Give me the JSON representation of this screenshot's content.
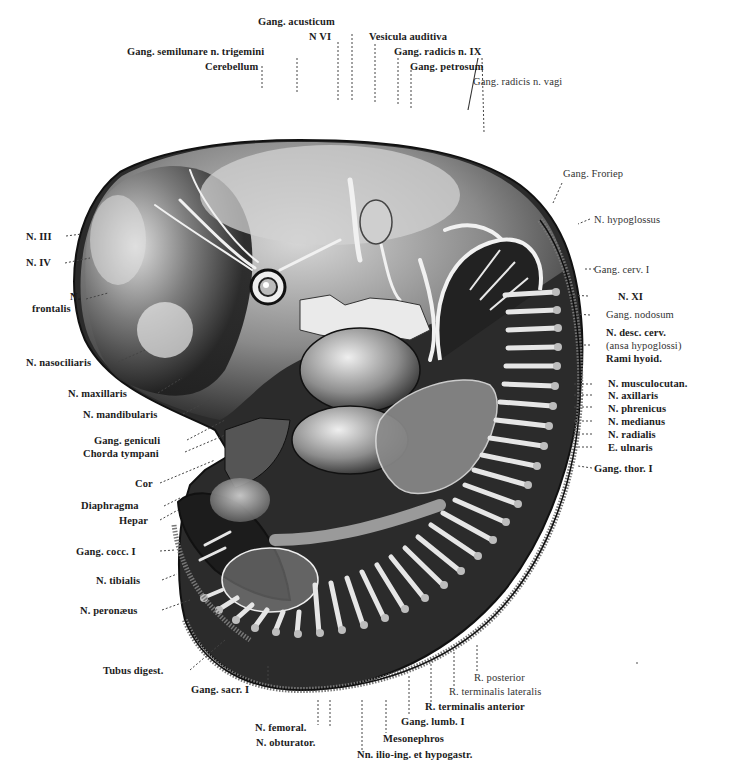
{
  "figure": {
    "background": "#ffffff",
    "ink": "#1a1a1a"
  },
  "labels": {
    "top": {
      "gang_acusticum": "Gang. acusticum",
      "n_vi": "N VI",
      "vesicula_auditiva": "Vesicula auditiva",
      "gang_semilunare": "Gang. semilunare n. trigemini",
      "gang_radicis_ix": "Gang. radicis n. IX",
      "cerebellum": "Cerebellum",
      "gang_petrosum": "Gang. petrosum",
      "gang_radicis_vagi": "Gang. radicis n. vagi"
    },
    "right": {
      "gang_froriep": "Gang. Froriep",
      "n_hypoglossus": "N. hypoglossus",
      "gang_cerv_i": "Gang. cerv. I",
      "n_xi": "N. XI",
      "gang_nodosum": "Gang. nodosum",
      "n_desc_cerv": "N. desc. cerv.",
      "ansa_hypoglossi": "(ansa hypoglossi)",
      "rami_hyoid": "Rami hyoid.",
      "n_musculocutan": "N. musculocutan.",
      "n_axillaris": "N. axillaris",
      "n_phrenicus": "N. phrenicus",
      "n_medianus": "N. medianus",
      "n_radialis": "N. radialis",
      "e_ulnaris": "E. ulnaris",
      "gang_thor_i": "Gang. thor. I"
    },
    "left": {
      "n_iii": "N. III",
      "n_iv": "N. IV",
      "n_frontalis_1": "N.",
      "n_frontalis_2": "frontalis",
      "n_nasociliaris": "N. nasociliaris",
      "n_maxillaris": "N. maxillaris",
      "n_mandibularis": "N. mandibularis",
      "gang_geniculi": "Gang. geniculi",
      "chorda_tympani": "Chorda tympani",
      "cor": "Cor",
      "diaphragma": "Diaphragma",
      "hepar": "Hepar",
      "gang_cocc_i": "Gang. cocc. I",
      "n_tibialis": "N. tibialis",
      "n_peronaeus": "N. peronæus"
    },
    "bottom": {
      "tubus_digest": "Tubus digest.",
      "gang_sacr_i": "Gang. sacr. I",
      "r_posterior": "R. posterior",
      "r_terminalis_lateralis": "R. terminalis lateralis",
      "r_terminalis_anterior": "R. terminalis anterior",
      "gang_lumb_i": "Gang. lumb. I",
      "n_femoral": "N. femoral.",
      "mesonephros": "Mesonephros",
      "n_obturator": "N. obturator.",
      "nn_ilio_ing": "Nn. ilio-ing. et hypogastr."
    }
  }
}
